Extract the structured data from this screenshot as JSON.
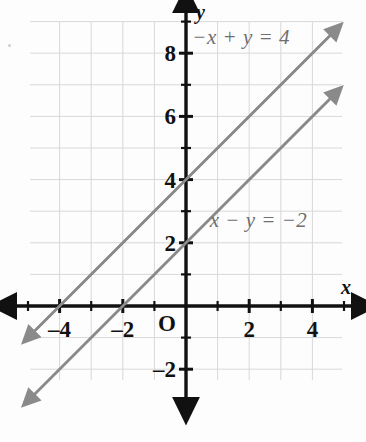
{
  "figure": {
    "kind": "coordinate-plane-graph",
    "axis_labels": {
      "x": "x",
      "y": "y",
      "origin": "O"
    },
    "colors": {
      "grid": "#d8d8d8",
      "axis": "#111111",
      "line": "#8a8a8a",
      "label_text": "#6f6f6f",
      "tick_text": "#111111",
      "background": "#fdfdfd"
    }
  },
  "chart_data": {
    "type": "line",
    "title": "",
    "xlabel": "x",
    "ylabel": "y",
    "xlim": [
      -5,
      5
    ],
    "ylim": [
      -2.4,
      9
    ],
    "grid": true,
    "legend": "inline-annotations",
    "xticks": [
      -4,
      -2,
      2,
      4
    ],
    "xticklabels": [
      "–4",
      "–2",
      "2",
      "4"
    ],
    "yticks": [
      8,
      6,
      4,
      2,
      -2
    ],
    "yticklabels": [
      "8",
      "6",
      "4",
      "2",
      "–2"
    ],
    "minor_tick_step": 1,
    "origin_label": "O",
    "series": [
      {
        "name": "−x + y = 4",
        "equation_label": "−x + y = 4",
        "slope": 1,
        "intercept": 4,
        "x": [
          -4.85,
          4.62
        ],
        "y": [
          -0.85,
          8.62
        ],
        "arrows": "both",
        "label_position": {
          "x": 0.2,
          "y": 8.55
        }
      },
      {
        "name": "x − y = −2",
        "equation_label": "x − y = −2",
        "slope": 1,
        "intercept": 2,
        "x": [
          -4.85,
          4.62
        ],
        "y": [
          -2.85,
          6.62
        ],
        "arrows": "both",
        "label_position": {
          "x": 0.75,
          "y": 2.75
        }
      }
    ],
    "intersection": "none (parallel lines)",
    "annotations": [
      {
        "text": "−x + y = 4",
        "x": 0.2,
        "y": 8.55
      },
      {
        "text": "x − y = −2",
        "x": 0.75,
        "y": 2.75
      }
    ]
  }
}
